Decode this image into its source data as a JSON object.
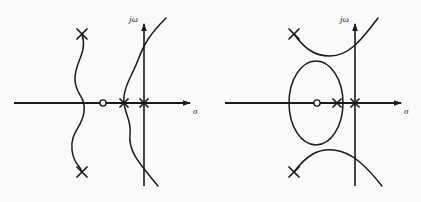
{
  "figure": {
    "background_color": "#fafafa",
    "ink_color": "#1a1a1a",
    "width": 421,
    "height": 202
  },
  "plots": [
    {
      "id": "left-plot",
      "name": "root-locus-left",
      "description": "Root locus with two sinusoidal (S-shaped) vertical branches crossing the real axis",
      "axes": {
        "real": {
          "label": "σ",
          "label_name": "sigma",
          "y": 103,
          "x_start": 14,
          "x_end": 196,
          "arrow": "right"
        },
        "imaginary": {
          "label": "jω",
          "label_name": "j-omega",
          "x": 144,
          "y_start": 20,
          "y_end": 186,
          "arrow": "up"
        }
      },
      "zeros": [
        {
          "name": "zero-1",
          "x": 103,
          "y": 103,
          "marker": "circle"
        }
      ],
      "poles": [
        {
          "name": "pole-upper-left",
          "x": 82,
          "y": 34,
          "marker": "x"
        },
        {
          "name": "pole-lower-left",
          "x": 82,
          "y": 172,
          "marker": "x"
        },
        {
          "name": "pole-real-inner",
          "x": 124,
          "y": 103,
          "marker": "x"
        },
        {
          "name": "pole-real-on-axis",
          "x": 144,
          "y": 103,
          "marker": "x"
        }
      ],
      "branches": [
        {
          "name": "branch-left-sinusoid",
          "path": "M 82,34 C 88,54 74,62 75,80 C 76,96 86,96 84,112 C 82,128 70,132 72,150 C 74,166 80,164 82,172"
        },
        {
          "name": "branch-right-sinusoid",
          "path": "M 166,18 C 150,34 144,44 138,60 C 132,76 126,82 124,96 C 122,112 132,118 130,134 C 128,152 140,164 158,186"
        }
      ]
    },
    {
      "id": "right-plot",
      "name": "root-locus-right",
      "description": "Root locus with a closed elliptical branch plus two hyperbolic branches above and below",
      "axes": {
        "real": {
          "label": "σ",
          "label_name": "sigma",
          "y": 103,
          "x_start": 225,
          "x_end": 407,
          "arrow": "right"
        },
        "imaginary": {
          "label": "jω",
          "label_name": "j-omega",
          "x": 355,
          "y_start": 20,
          "y_end": 186,
          "arrow": "up"
        }
      },
      "zeros": [
        {
          "name": "zero-1",
          "x": 317,
          "y": 103,
          "marker": "circle"
        }
      ],
      "poles": [
        {
          "name": "pole-upper-branch-end",
          "x": 294,
          "y": 34,
          "marker": "x"
        },
        {
          "name": "pole-lower-branch-end",
          "x": 294,
          "y": 172,
          "marker": "x"
        },
        {
          "name": "pole-real-inner",
          "x": 337,
          "y": 103,
          "marker": "x"
        },
        {
          "name": "pole-real-on-axis",
          "x": 355,
          "y": 103,
          "marker": "x"
        }
      ],
      "branches": [
        {
          "name": "branch-ellipse",
          "shape": "ellipse",
          "cx": 316,
          "cy": 103,
          "rx": 27,
          "ry": 42
        },
        {
          "name": "branch-upper-hyperbola",
          "path": "M 294,34 C 304,48 314,56 330,56 C 348,56 360,42 378,18"
        },
        {
          "name": "branch-lower-hyperbola",
          "path": "M 294,172 C 306,156 318,148 334,150 C 352,152 366,166 382,186"
        }
      ]
    }
  ],
  "legend": {
    "pole_marker_label": "×",
    "zero_marker_label": "○",
    "pole_meaning": "open-loop pole",
    "zero_meaning": "open-loop zero"
  }
}
